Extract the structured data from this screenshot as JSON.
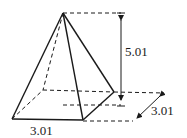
{
  "diagram": {
    "height_label": "5.01",
    "base_width_label": "3.01",
    "base_depth_label": "3.01"
  }
}
